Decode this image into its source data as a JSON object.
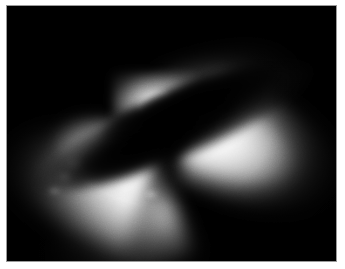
{
  "image": {
    "subject": "active-galactic-nucleus-dust-torus",
    "alt_text": "Dark dust torus seen edge-on across the bright core of a galaxy, with bipolar cones of light escaping above and below forming an X shape",
    "caption": "",
    "orientation": "landscape",
    "width_px": 345,
    "height_px": 269
  },
  "frame": {
    "margin_color": "#ffffff",
    "border_line_color": "#9a9a9a",
    "border_width_px": 1,
    "margin_left_px": 6,
    "margin_top_px": 5,
    "inner_width_px": 331,
    "inner_height_px": 257
  },
  "scene": {
    "background_color": "#000000",
    "highlight_color": "#ffffff",
    "dust_color": "#000000",
    "midtone_color": "#8c8c8c",
    "features": [
      {
        "name": "bright-core",
        "label": "Galactic nucleus",
        "center_pct": [
          45,
          38
        ],
        "brightness": "peak"
      },
      {
        "name": "dust-torus",
        "label": "Edge-on dust lane",
        "angle_deg": -23,
        "length_pct": 92,
        "thickness_pct": 25
      },
      {
        "name": "cone-upper-left",
        "label": "Upper-left ionization cone",
        "angle_deg": 199,
        "brightness": "very bright"
      },
      {
        "name": "cone-lower-right",
        "label": "Lower-right ionization cone",
        "angle_deg": 22,
        "brightness": "very bright"
      },
      {
        "name": "cone-lower-left",
        "label": "Lower-left scattered-light fan",
        "angle_deg": 157,
        "brightness": "faint, mottled"
      },
      {
        "name": "cone-upper-right",
        "label": "Upper-right scattered-light fan",
        "angle_deg": -20,
        "brightness": "faintest"
      }
    ]
  }
}
